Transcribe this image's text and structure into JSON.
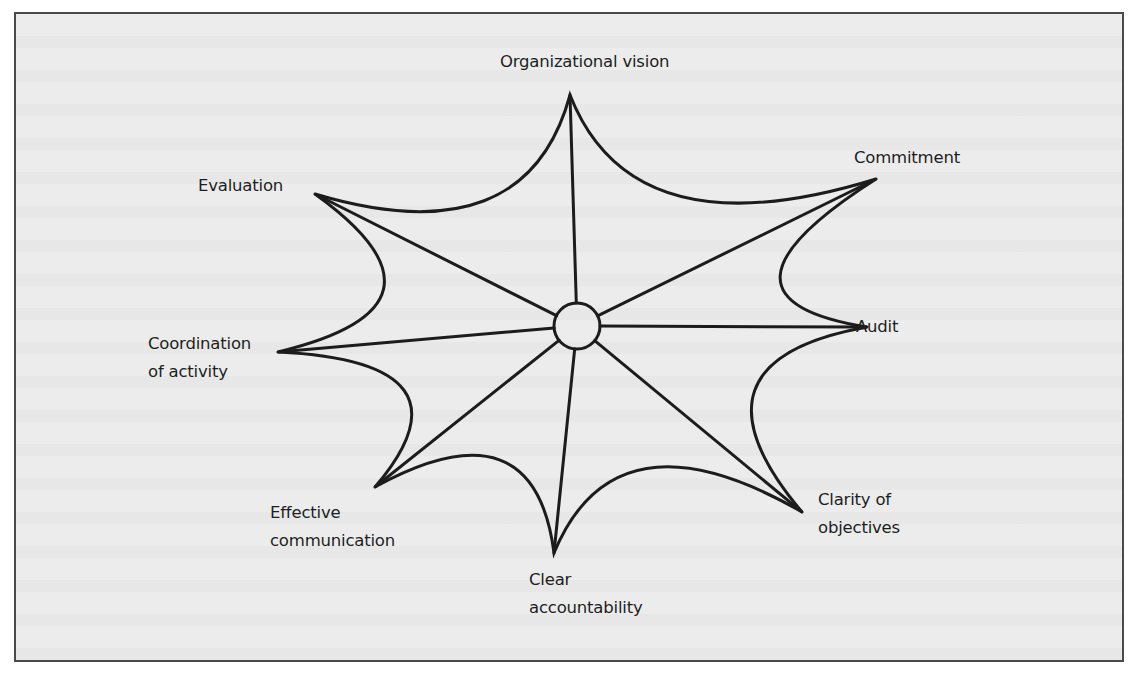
{
  "figure": {
    "type": "star-web diagram",
    "center": {
      "x": 577,
      "y": 326,
      "radius": 23
    },
    "colors": {
      "background": "#ececec",
      "frame_border": "#4a4a4a",
      "stroke": "#1c1c1c",
      "text": "#1e1e1e"
    },
    "nodes": [
      {
        "id": "organizational-vision",
        "lines": [
          "Organizational vision"
        ],
        "tip": [
          570,
          95
        ]
      },
      {
        "id": "commitment",
        "lines": [
          "Commitment"
        ],
        "tip": [
          876,
          179
        ]
      },
      {
        "id": "audit",
        "lines": [
          "Audit"
        ],
        "tip": [
          867,
          327
        ]
      },
      {
        "id": "clarity-of-objectives",
        "lines": [
          "Clarity of",
          "objectives"
        ],
        "tip": [
          802,
          512
        ]
      },
      {
        "id": "clear-accountability",
        "lines": [
          "Clear",
          "accountability"
        ],
        "tip": [
          554,
          553
        ]
      },
      {
        "id": "effective-communication",
        "lines": [
          "Effective",
          "communication"
        ],
        "tip": [
          375,
          487
        ]
      },
      {
        "id": "coordination-of-activity",
        "lines": [
          "Coordination",
          "of activity"
        ],
        "tip": [
          278,
          352
        ]
      },
      {
        "id": "evaluation",
        "lines": [
          "Evaluation"
        ],
        "tip": [
          315,
          194
        ]
      }
    ]
  },
  "labels": {
    "organizational_vision": "Organizational vision",
    "commitment": "Commitment",
    "audit": "Audit",
    "clarity_line1": "Clarity of",
    "clarity_line2": "objectives",
    "clear_line1": "Clear",
    "clear_line2": "accountability",
    "effective_line1": "Effective",
    "effective_line2": "communication",
    "coordination_line1": "Coordination",
    "coordination_line2": "of activity",
    "evaluation": "Evaluation"
  }
}
